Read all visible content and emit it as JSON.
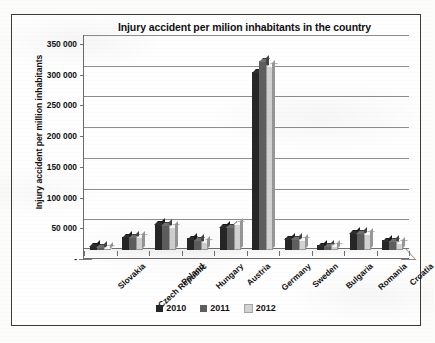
{
  "chart_data": {
    "type": "bar",
    "title": "Injury accident per milion inhabitants in the country",
    "xlabel": "",
    "ylabel": "Injury accident per million inhabitants",
    "categories": [
      "Slovakia",
      "Czech Republic",
      "Poland",
      "Hungary",
      "Austria",
      "Germany",
      "Sweden",
      "Bulgaria",
      "Romania",
      "Croatia"
    ],
    "series": [
      {
        "name": "2010",
        "color": "#262626",
        "values": [
          7000,
          22000,
          43000,
          19000,
          38000,
          290000,
          19000,
          8000,
          28000,
          16000
        ]
      },
      {
        "name": "2011",
        "color": "#5e5e5e",
        "values": [
          6000,
          22000,
          41000,
          17000,
          39000,
          308000,
          19000,
          7000,
          28000,
          15000
        ]
      },
      {
        "name": "2012",
        "color": "#d2d2d2",
        "values": [
          5000,
          23000,
          40000,
          15000,
          44000,
          302000,
          18000,
          9000,
          28000,
          14000
        ]
      }
    ],
    "ylim": [
      0,
      350000
    ],
    "ytick_values": [
      0,
      50000,
      100000,
      150000,
      200000,
      250000,
      300000,
      350000
    ],
    "ytick_labels": [
      "-",
      "50 000",
      "100 000",
      "150 000",
      "200 000",
      "250 000",
      "300 000",
      "350 000"
    ],
    "grid": true,
    "legend_position": "bottom",
    "legend_entries": [
      "2010",
      "2011",
      "2012"
    ]
  }
}
